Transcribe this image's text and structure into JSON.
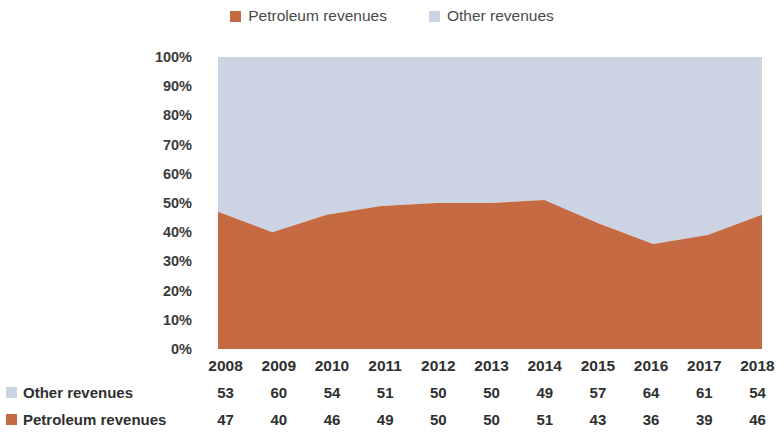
{
  "legend": {
    "entries": [
      {
        "label": "Petroleum revenues",
        "color": "#c56a42",
        "icon": "legend-square-icon"
      },
      {
        "label": "Other revenues",
        "color": "#ccd4e4",
        "icon": "legend-square-icon"
      }
    ]
  },
  "y_axis": {
    "ticks": [
      "100%",
      "90%",
      "80%",
      "70%",
      "60%",
      "50%",
      "40%",
      "30%",
      "20%",
      "10%",
      "0%"
    ]
  },
  "table": {
    "other_label": "Other revenues",
    "petroleum_label": "Petroleum revenues"
  },
  "chart_data": {
    "type": "area",
    "stacked": true,
    "normalized": true,
    "title": "",
    "subtitle": "",
    "xlabel": "",
    "ylabel": "",
    "ylim": [
      0,
      100
    ],
    "ytick_labels": [
      "0%",
      "10%",
      "20%",
      "30%",
      "40%",
      "50%",
      "60%",
      "70%",
      "80%",
      "90%",
      "100%"
    ],
    "ytick_values": [
      0,
      10,
      20,
      30,
      40,
      50,
      60,
      70,
      80,
      90,
      100
    ],
    "grid": false,
    "legend_position": "top-center",
    "categories": [
      "2008",
      "2009",
      "2010",
      "2011",
      "2012",
      "2013",
      "2014",
      "2015",
      "2016",
      "2017",
      "2018"
    ],
    "series": [
      {
        "name": "Petroleum revenues",
        "color": "#c56a42",
        "values": [
          47,
          40,
          46,
          49,
          50,
          50,
          51,
          43,
          36,
          39,
          46
        ]
      },
      {
        "name": "Other revenues",
        "color": "#ccd4e4",
        "values": [
          53,
          60,
          54,
          51,
          50,
          50,
          49,
          57,
          64,
          61,
          54
        ]
      }
    ]
  }
}
